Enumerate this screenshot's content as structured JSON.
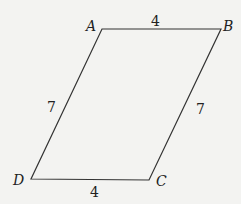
{
  "diagram": {
    "type": "parallelogram",
    "background": "#f3f3f1",
    "stroke": "#333333",
    "vertices": [
      {
        "name": "A",
        "x": 102,
        "y": 29,
        "label_x": 86,
        "label_y": 31
      },
      {
        "name": "B",
        "x": 221,
        "y": 29,
        "label_x": 223,
        "label_y": 31
      },
      {
        "name": "C",
        "x": 149,
        "y": 180,
        "label_x": 156,
        "label_y": 186
      },
      {
        "name": "D",
        "x": 31,
        "y": 179,
        "label_x": 13,
        "label_y": 185
      }
    ],
    "sides": [
      {
        "name": "AB",
        "length": "4",
        "label_x": 151,
        "label_y": 26
      },
      {
        "name": "BC",
        "length": "7",
        "label_x": 196,
        "label_y": 114
      },
      {
        "name": "CD",
        "length": "4",
        "label_x": 90,
        "label_y": 197
      },
      {
        "name": "DA",
        "length": "7",
        "label_x": 47,
        "label_y": 112
      }
    ]
  }
}
